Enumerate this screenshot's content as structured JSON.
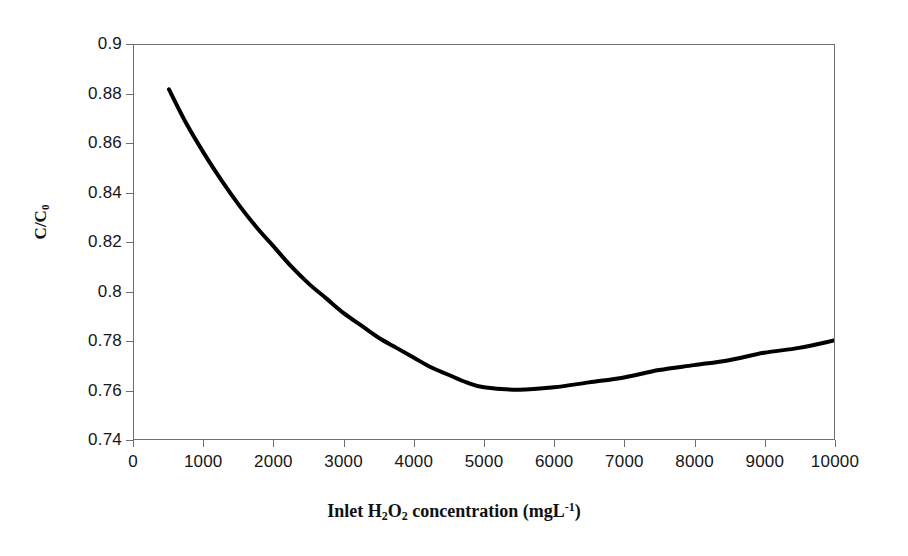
{
  "chart_data": {
    "type": "line",
    "title": "",
    "xlabel": "Inlet H2O2 concentration (mgL-1)",
    "xlabel_parts": {
      "pre": "Inlet H",
      "sub1": "2",
      "mid": "O",
      "sub2": "2",
      "post": " concentration (mgL",
      "sup": "-1",
      "tail": ")"
    },
    "ylabel": "C/C0",
    "ylabel_parts": {
      "pre": "C/C",
      "sub": "0"
    },
    "xlim": [
      0,
      10000
    ],
    "ylim": [
      0.74,
      0.9
    ],
    "grid": false,
    "legend": null,
    "x_ticks": [
      0,
      1000,
      2000,
      3000,
      4000,
      5000,
      6000,
      7000,
      8000,
      9000,
      10000
    ],
    "x_tick_labels": [
      "0",
      "1000",
      "2000",
      "3000",
      "4000",
      "5000",
      "6000",
      "7000",
      "8000",
      "9000",
      "10000"
    ],
    "y_ticks": [
      0.74,
      0.76,
      0.78,
      0.8,
      0.82,
      0.84,
      0.86,
      0.88,
      0.9
    ],
    "y_tick_labels": [
      "0.74",
      "0.76",
      "0.78",
      "0.8",
      "0.82",
      "0.84",
      "0.86",
      "0.88",
      "0.9"
    ],
    "series": [
      {
        "name": "C/C0 vs inlet H2O2 concentration",
        "color": "#000000",
        "line_width": 4,
        "x": [
          500,
          750,
          1000,
          1250,
          1500,
          1750,
          2000,
          2250,
          2500,
          2750,
          3000,
          3250,
          3500,
          3750,
          4000,
          4250,
          4500,
          4750,
          5000,
          5500,
          6000,
          6500,
          7000,
          7500,
          8000,
          8500,
          9000,
          9500,
          10000
        ],
        "y": [
          0.882,
          0.868,
          0.856,
          0.845,
          0.835,
          0.826,
          0.818,
          0.81,
          0.803,
          0.797,
          0.791,
          0.786,
          0.781,
          0.777,
          0.773,
          0.769,
          0.766,
          0.763,
          0.761,
          0.76,
          0.761,
          0.763,
          0.765,
          0.768,
          0.77,
          0.772,
          0.775,
          0.777,
          0.78
        ]
      }
    ],
    "annotations": {
      "minimum_x": 5200,
      "minimum_y": 0.76,
      "start_x": 500,
      "start_y": 0.882,
      "end_x": 10000,
      "end_y": 0.78
    },
    "axis_color": "#6f6f6f"
  }
}
